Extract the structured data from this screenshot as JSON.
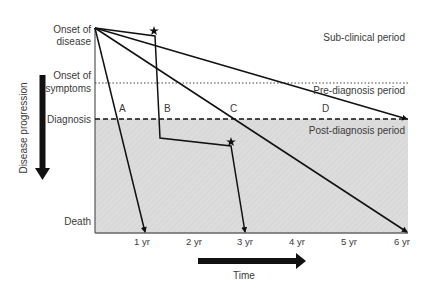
{
  "y_labels": {
    "onset_disease": [
      "Onset of",
      "disease"
    ],
    "onset_symptoms": [
      "Onset of",
      "symptoms"
    ],
    "diagnosis": "Diagnosis",
    "death": "Death"
  },
  "periods": {
    "subclinical": "Sub-clinical period",
    "prediagnosis": "Pre-diagnosis period",
    "postdiagnosis": "Post-diagnosis period"
  },
  "axis": {
    "y_title": "Disease progression",
    "x_title": "Time",
    "x_ticks": [
      "1 yr",
      "2 yr",
      "3 yr",
      "4 yr",
      "5 yr",
      "6 yr"
    ]
  },
  "paths": [
    {
      "label": "A",
      "description": "Rapid progression to death at ~1 yr"
    },
    {
      "label": "B",
      "description": "Progression with two treatment/intervention events (stars), death at ~3 yr"
    },
    {
      "label": "C",
      "description": "Steady progression to death at ~6 yr"
    },
    {
      "label": "D",
      "description": "Slow progression reaching diagnosis at ~6 yr"
    }
  ],
  "colors": {
    "shade": "#d9d9d9",
    "line": "#111111",
    "text": "#3a3a3a"
  }
}
